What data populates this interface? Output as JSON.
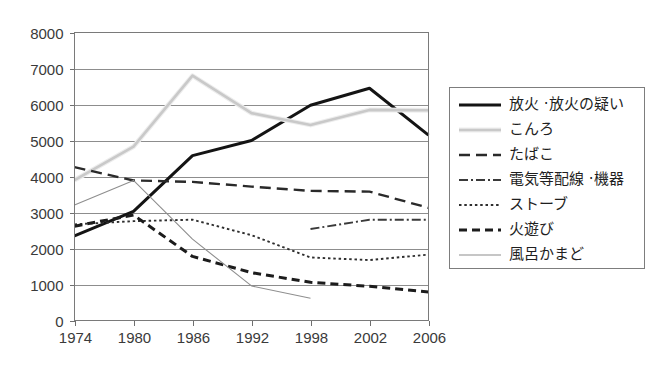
{
  "chart_data": {
    "type": "line",
    "title": "",
    "xlabel": "",
    "ylabel": "",
    "xlim": [
      1974,
      2006
    ],
    "ylim": [
      0,
      8000
    ],
    "grid": true,
    "legend_position": "right",
    "x": [
      1974,
      1980,
      1986,
      1992,
      1998,
      2002,
      2006
    ],
    "xtick_labels": [
      "1974",
      "1980",
      "1986",
      "1992",
      "1998",
      "2002",
      "2006"
    ],
    "ytick_labels": [
      "0",
      "1000",
      "2000",
      "3000",
      "4000",
      "5000",
      "6000",
      "7000",
      "8000"
    ],
    "ytick_values": [
      0,
      1000,
      2000,
      3000,
      4000,
      5000,
      6000,
      7000,
      8000
    ],
    "series": [
      {
        "name": "放火・放火の疑い",
        "style": "solid-thick-black",
        "color": "#141414",
        "x": [
          1974,
          1980,
          1986,
          1992,
          1998,
          2002,
          2006
        ],
        "values": [
          2350,
          3030,
          4580,
          5000,
          5980,
          6450,
          5150
        ]
      },
      {
        "name": "こんろ",
        "style": "solid-light-gray",
        "color": "#c9c9c9",
        "x": [
          1974,
          1980,
          1986,
          1992,
          1998,
          2002,
          2006
        ],
        "values": [
          3900,
          4830,
          6800,
          5760,
          5430,
          5850,
          5840
        ]
      },
      {
        "name": "たばこ",
        "style": "long-dash",
        "color": "#2a2a2a",
        "x": [
          1974,
          1980,
          1986,
          1992,
          1998,
          2002,
          2006
        ],
        "values": [
          4260,
          3890,
          3850,
          3720,
          3600,
          3580,
          3130
        ]
      },
      {
        "name": "電気等配線・機器",
        "style": "dash-dot",
        "color": "#3a3a3a",
        "x": [
          1998,
          2002,
          2006
        ],
        "values": [
          2540,
          2800,
          2800
        ]
      },
      {
        "name": "ストーブ",
        "style": "dotted",
        "color": "#2e2e2e",
        "x": [
          1974,
          1980,
          1986,
          1992,
          1998,
          2002,
          2006
        ],
        "values": [
          2670,
          2760,
          2800,
          2370,
          1750,
          1680,
          1830
        ]
      },
      {
        "name": "火遊び",
        "style": "medium-dash-thick",
        "color": "#1c1c1c",
        "x": [
          1974,
          1980,
          1986,
          1992,
          1998,
          2002,
          2006
        ],
        "values": [
          2620,
          2930,
          1780,
          1330,
          1060,
          950,
          790
        ]
      },
      {
        "name": "風呂かまど",
        "style": "solid-thin-gray",
        "color": "#8e8e8e",
        "x": [
          1974,
          1980,
          1986,
          1992,
          1998
        ],
        "values": [
          3210,
          3890,
          2260,
          960,
          620
        ]
      }
    ]
  },
  "legend": {
    "items": [
      {
        "label": "放火 ·放火の疑い",
        "swatch": "solid-thick-black"
      },
      {
        "label": "こんろ",
        "swatch": "solid-light-gray"
      },
      {
        "label": "たばこ",
        "swatch": "long-dash"
      },
      {
        "label": "電気等配線 ·機器",
        "swatch": "dash-dot"
      },
      {
        "label": "ストーブ",
        "swatch": "dotted"
      },
      {
        "label": "火遊び",
        "swatch": "medium-dash-thick"
      },
      {
        "label": "風呂かまど",
        "swatch": "solid-thin-gray"
      }
    ]
  },
  "colors": {
    "background": "#ffffff",
    "gridline": "#8d8d8d",
    "axis": "#7a7a7a",
    "text": "#2b2b2b"
  }
}
